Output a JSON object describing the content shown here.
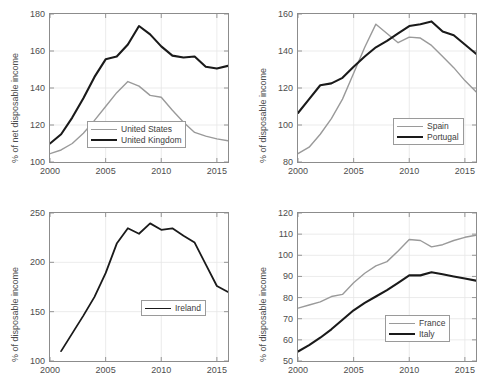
{
  "figure": {
    "background": "#ffffff",
    "axis_color": "#8c8c8c",
    "grid_color": "#e6e6e6",
    "text_color": "#4d4d4d"
  },
  "series_colors": {
    "grey": "#9a9a9a",
    "black": "#1a1a1a"
  },
  "chart_data": [
    {
      "id": "panel-anglo",
      "type": "line",
      "title": "",
      "xlabel": "",
      "ylabel": "% of net disposable income",
      "xlim": [
        2000,
        2016
      ],
      "ylim": [
        100,
        180
      ],
      "xticks": [
        2000,
        2005,
        2010,
        2015
      ],
      "yticks": [
        100,
        120,
        140,
        160,
        180
      ],
      "grid": true,
      "legend_position": "lower-center",
      "x": [
        2000,
        2001,
        2002,
        2003,
        2004,
        2005,
        2006,
        2007,
        2008,
        2009,
        2010,
        2011,
        2012,
        2013,
        2014,
        2015,
        2016
      ],
      "series": [
        {
          "name": "United States",
          "color": "#9a9a9a",
          "width": 1.4,
          "values": [
            104.5,
            106.5,
            110.0,
            115.5,
            122.5,
            130.0,
            137.5,
            143.5,
            141.0,
            136.0,
            135.0,
            128.0,
            121.5,
            116.0,
            114.0,
            112.5,
            111.5
          ]
        },
        {
          "name": "United Kingdom",
          "color": "#1a1a1a",
          "width": 2.1,
          "values": [
            110.0,
            115.0,
            124.0,
            134.5,
            146.0,
            155.5,
            157.0,
            163.5,
            173.5,
            169.0,
            162.5,
            157.5,
            156.5,
            157.0,
            151.5,
            150.5,
            152.0
          ]
        }
      ]
    },
    {
      "id": "panel-iberia",
      "type": "line",
      "title": "",
      "xlabel": "",
      "ylabel": "% of disposable income",
      "xlim": [
        2000,
        2016
      ],
      "ylim": [
        80,
        160
      ],
      "xticks": [
        2000,
        2005,
        2010,
        2015
      ],
      "yticks": [
        80,
        100,
        120,
        140,
        160
      ],
      "grid": true,
      "legend_position": "lower-right",
      "x": [
        2000,
        2001,
        2002,
        2003,
        2004,
        2005,
        2006,
        2007,
        2008,
        2009,
        2010,
        2011,
        2012,
        2013,
        2014,
        2015,
        2016
      ],
      "series": [
        {
          "name": "Spain",
          "color": "#9a9a9a",
          "width": 1.4,
          "values": [
            84.5,
            88.0,
            95.0,
            103.5,
            114.0,
            128.0,
            142.0,
            154.5,
            149.5,
            144.5,
            147.5,
            147.0,
            143.0,
            137.0,
            131.0,
            124.0,
            118.0
          ]
        },
        {
          "name": "Portugal",
          "color": "#1a1a1a",
          "width": 2.1,
          "values": [
            106.5,
            114.0,
            121.5,
            122.5,
            125.5,
            131.5,
            137.0,
            142.0,
            145.5,
            149.5,
            153.5,
            154.5,
            156.0,
            150.5,
            148.5,
            143.5,
            138.5
          ]
        }
      ]
    },
    {
      "id": "panel-ireland",
      "type": "line",
      "title": "",
      "xlabel": "",
      "ylabel": "% of disposable income",
      "xlim": [
        2000,
        2016
      ],
      "ylim": [
        100,
        250
      ],
      "xticks": [
        2000,
        2005,
        2010,
        2015
      ],
      "yticks": [
        100,
        150,
        200,
        250
      ],
      "grid": true,
      "legend_position": "center-right",
      "x": [
        2001,
        2002,
        2003,
        2004,
        2005,
        2006,
        2007,
        2008,
        2009,
        2010,
        2011,
        2012,
        2013,
        2014,
        2015,
        2016
      ],
      "series": [
        {
          "name": "Ireland",
          "color": "#1a1a1a",
          "width": 1.8,
          "values": [
            110.0,
            128.0,
            146.0,
            165.0,
            189.0,
            219.0,
            234.5,
            229.0,
            239.5,
            233.0,
            234.5,
            227.0,
            220.0,
            198.0,
            176.0,
            170.0
          ]
        }
      ]
    },
    {
      "id": "panel-france-italy",
      "type": "line",
      "title": "",
      "xlabel": "",
      "ylabel": "% of disposable income",
      "xlim": [
        2000,
        2016
      ],
      "ylim": [
        50,
        120
      ],
      "xticks": [
        2000,
        2005,
        2010,
        2015
      ],
      "yticks": [
        50,
        60,
        70,
        80,
        90,
        100,
        110,
        120
      ],
      "grid": true,
      "legend_position": "lower-right",
      "x": [
        2000,
        2001,
        2002,
        2003,
        2004,
        2005,
        2006,
        2007,
        2008,
        2009,
        2010,
        2011,
        2012,
        2013,
        2014,
        2015,
        2016
      ],
      "series": [
        {
          "name": "France",
          "color": "#9a9a9a",
          "width": 1.4,
          "values": [
            75.0,
            76.5,
            78.0,
            80.5,
            81.5,
            87.0,
            91.5,
            95.0,
            97.0,
            102.0,
            107.5,
            107.0,
            104.0,
            105.0,
            107.0,
            108.5,
            109.5
          ]
        },
        {
          "name": "Italy",
          "color": "#1a1a1a",
          "width": 2.1,
          "values": [
            54.5,
            57.5,
            61.0,
            65.0,
            69.5,
            74.0,
            77.5,
            80.5,
            83.5,
            87.0,
            90.5,
            90.5,
            92.0,
            91.0,
            90.0,
            89.0,
            88.0
          ]
        }
      ]
    }
  ]
}
